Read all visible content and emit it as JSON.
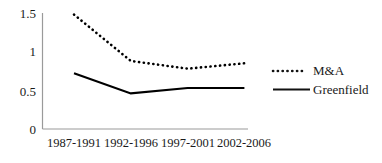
{
  "chart_data": {
    "type": "line",
    "title": "",
    "subtitle": "",
    "xlabel": "",
    "ylabel": "",
    "categories": [
      "1987-1991",
      "1992-1996",
      "1997-2001",
      "2002-2006"
    ],
    "series": [
      {
        "name": "M&A",
        "style": "dotted",
        "color": "#000000",
        "values": [
          1.48,
          0.88,
          0.78,
          0.85
        ]
      },
      {
        "name": "Greenfield",
        "style": "solid",
        "color": "#000000",
        "values": [
          0.72,
          0.46,
          0.53,
          0.53
        ]
      }
    ],
    "ylim": [
      0,
      1.5
    ],
    "y_ticks": [
      "0",
      "0.5",
      "1",
      "1.5"
    ],
    "y_tick_values": [
      0,
      0.5,
      1,
      1.5
    ],
    "grid": false,
    "legend_position": "right",
    "axis_color": "#808080"
  },
  "axis": {
    "y_labels": [
      "1.5",
      "1",
      "0.5",
      "0"
    ],
    "x_labels": [
      "1987-1991",
      "1992-1996",
      "1997-2001",
      "2002-2006"
    ]
  },
  "legend": {
    "entries": [
      {
        "label": "M&A",
        "style": "dotted"
      },
      {
        "label": "Greenfield",
        "style": "solid"
      }
    ]
  }
}
